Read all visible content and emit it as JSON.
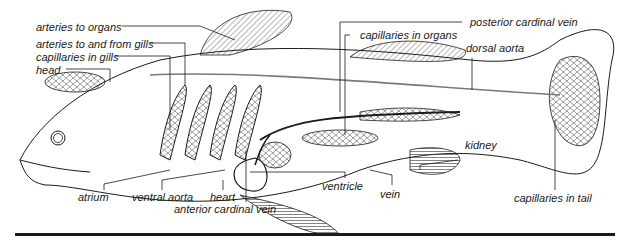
{
  "diagram": {
    "labels": {
      "arteries_to_organs": "arteries to organs",
      "arteries_gills": "arteries to and from gills",
      "capillaries_gills": "capillaries in gills",
      "head": "head",
      "posterior_cardinal_vein": "posterior cardinal vein",
      "capillaries_organs": "capillaries in organs",
      "dorsal_aorta": "dorsal aorta",
      "kidney": "kidney",
      "capillaries_tail": "capillaries in tail",
      "atrium": "atrium",
      "ventral_aorta": "ventral aorta",
      "heart": "heart",
      "anterior_cardinal_vein": "anterior cardinal vein",
      "ventricle": "ventricle",
      "vein": "vein"
    },
    "colors": {
      "ink": "#1a1a1a",
      "artery_gray": "#7a7a7a",
      "background": "#ffffff"
    }
  }
}
